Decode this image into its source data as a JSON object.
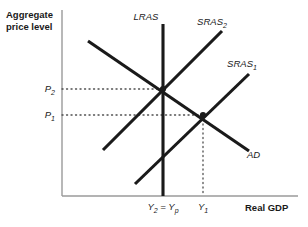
{
  "figure": {
    "type": "ad-as-diagram",
    "background": "#ffffff",
    "curve_color": "#1a1a1a",
    "axis_color": "#9a9a9a",
    "dot_color": "#4d4d4d"
  },
  "axes": {
    "y_title_line1": "Aggregate",
    "y_title_line2": "price level",
    "x_title": "Real GDP",
    "origin": {
      "x": 62,
      "y": 196
    },
    "y_axis_top": 10,
    "x_axis_right": 298
  },
  "price_ticks": [
    {
      "name": "P2",
      "base": "P",
      "sub": "2",
      "y": 89,
      "leader_to_x": 163
    },
    {
      "name": "P1",
      "base": "P",
      "sub": "1",
      "y": 115,
      "leader_to_x": 203
    }
  ],
  "output_ticks": [
    {
      "name": "Y2=Yp",
      "text_base": "Y",
      "text_sub": "2",
      "text_mid": " = ",
      "text_base2": "Y",
      "text_sub2": "p",
      "x": 163,
      "has_drop_line": false
    },
    {
      "name": "Y1",
      "text_base": "Y",
      "text_sub": "1",
      "x": 203,
      "has_drop_line": true
    }
  ],
  "curves": [
    {
      "name": "LRAS",
      "label_base": "LRAS",
      "label_sub": "",
      "x1": 163,
      "y1": 24,
      "x2": 163,
      "y2": 196,
      "label_x": 146,
      "label_y": 20
    },
    {
      "name": "SRAS2",
      "label_base": "SRAS",
      "label_sub": "2",
      "x1": 103,
      "y1": 150,
      "x2": 222,
      "y2": 31,
      "label_x": 212,
      "label_y": 25
    },
    {
      "name": "SRAS1",
      "label_base": "SRAS",
      "label_sub": "1",
      "x1": 135,
      "y1": 184,
      "x2": 249,
      "y2": 74,
      "label_x": 242,
      "label_y": 67
    },
    {
      "name": "AD",
      "label_base": "AD",
      "label_sub": "",
      "x1": 88,
      "y1": 41,
      "x2": 249,
      "y2": 151,
      "label_x": 247,
      "label_y": 158
    }
  ],
  "equilibria": [
    {
      "name": "long-run-equilibrium",
      "x": 163,
      "y": 89
    },
    {
      "name": "short-run-equilibrium",
      "x": 203,
      "y": 115
    }
  ]
}
